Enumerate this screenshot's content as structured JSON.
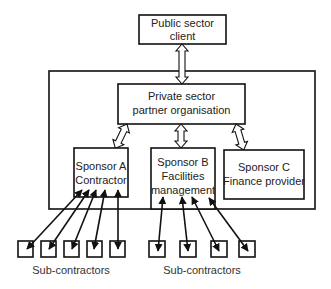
{
  "diagram": {
    "type": "organisational structure",
    "nodes": {
      "client": {
        "line1": "Public sector",
        "line2": "client"
      },
      "partner": {
        "line1": "Private sector",
        "line2": "partner organisation"
      },
      "sponsor_a": {
        "line1": "Sponsor A",
        "line2": "Contractor"
      },
      "sponsor_b": {
        "line1": "Sponsor B",
        "line2": "Facilities",
        "line3": "management"
      },
      "sponsor_c": {
        "line1": "Sponsor C",
        "line2": "Finance provider"
      }
    },
    "subcontractor_groups": [
      {
        "label": "Sub-contractors",
        "count": 5,
        "linked_to": "Sponsor A Contractor"
      },
      {
        "label": "Sub-contractors",
        "count": 4,
        "linked_to": "Sponsor B Facilities management"
      }
    ],
    "connections": [
      {
        "from": "Public sector client",
        "to": "Private sector partner organisation",
        "style": "hollow double arrow"
      },
      {
        "from": "Private sector partner organisation",
        "to": "Sponsor A Contractor",
        "style": "hollow double arrow"
      },
      {
        "from": "Private sector partner organisation",
        "to": "Sponsor B Facilities management",
        "style": "hollow double arrow"
      },
      {
        "from": "Private sector partner organisation",
        "to": "Sponsor C Finance provider",
        "style": "hollow double arrow"
      },
      {
        "from": "Sponsor A Contractor",
        "to": "Sub-contractors (5)",
        "style": "solid double arrow"
      },
      {
        "from": "Sponsor B Facilities management",
        "to": "Sub-contractors (4)",
        "style": "solid double arrow"
      }
    ],
    "colors": {
      "stroke": "#111111",
      "fill": "#ffffff",
      "text": "#222222"
    }
  }
}
